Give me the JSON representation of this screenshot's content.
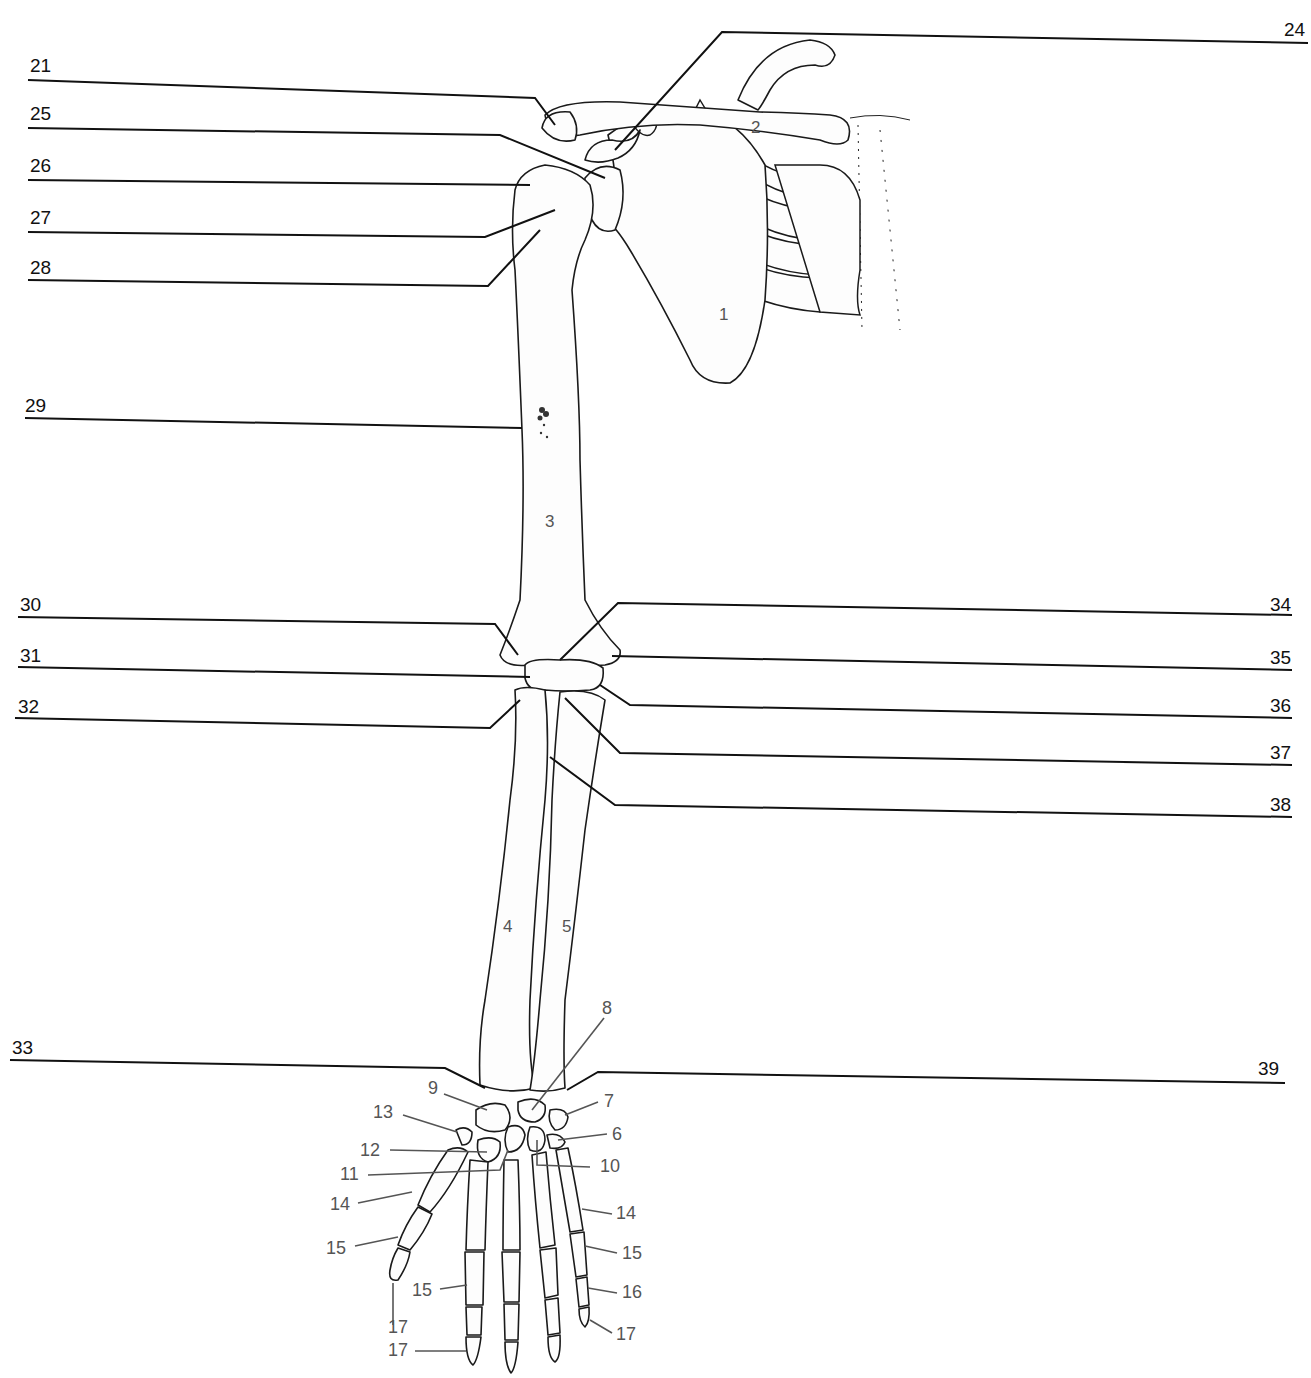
{
  "diagram": {
    "blank_labels": [
      {
        "id": "21",
        "text": "21",
        "side": "left",
        "tx": 30,
        "ty": 72,
        "line": [
          [
            28,
            80
          ],
          [
            535,
            98
          ],
          [
            555,
            125
          ]
        ]
      },
      {
        "id": "25",
        "text": "25",
        "side": "left",
        "tx": 30,
        "ty": 120,
        "line": [
          [
            28,
            128
          ],
          [
            500,
            135
          ],
          [
            605,
            178
          ]
        ]
      },
      {
        "id": "26",
        "text": "26",
        "side": "left",
        "tx": 30,
        "ty": 172,
        "line": [
          [
            28,
            180
          ],
          [
            530,
            185
          ]
        ]
      },
      {
        "id": "27",
        "text": "27",
        "side": "left",
        "tx": 30,
        "ty": 224,
        "line": [
          [
            28,
            232
          ],
          [
            485,
            237
          ],
          [
            555,
            210
          ]
        ]
      },
      {
        "id": "28",
        "text": "28",
        "side": "left",
        "tx": 30,
        "ty": 274,
        "line": [
          [
            28,
            280
          ],
          [
            488,
            286
          ],
          [
            540,
            230
          ]
        ]
      },
      {
        "id": "29",
        "text": "29",
        "side": "left",
        "tx": 25,
        "ty": 412,
        "line": [
          [
            25,
            418
          ],
          [
            522,
            428
          ]
        ]
      },
      {
        "id": "30",
        "text": "30",
        "side": "left",
        "tx": 20,
        "ty": 611,
        "line": [
          [
            18,
            617
          ],
          [
            495,
            624
          ],
          [
            518,
            655
          ]
        ]
      },
      {
        "id": "31",
        "text": "31",
        "side": "left",
        "tx": 20,
        "ty": 662,
        "line": [
          [
            18,
            667
          ],
          [
            530,
            677
          ]
        ]
      },
      {
        "id": "32",
        "text": "32",
        "side": "left",
        "tx": 18,
        "ty": 713,
        "line": [
          [
            15,
            718
          ],
          [
            490,
            728
          ],
          [
            520,
            700
          ]
        ]
      },
      {
        "id": "33",
        "text": "33",
        "side": "left",
        "tx": 12,
        "ty": 1054,
        "line": [
          [
            10,
            1060
          ],
          [
            445,
            1068
          ],
          [
            485,
            1088
          ]
        ]
      },
      {
        "id": "24",
        "text": "24",
        "side": "right",
        "tx": 1284,
        "ty": 36,
        "line": [
          [
            1308,
            43
          ],
          [
            722,
            32
          ],
          [
            615,
            150
          ]
        ]
      },
      {
        "id": "34",
        "text": "34",
        "side": "right",
        "tx": 1270,
        "ty": 611,
        "line": [
          [
            1292,
            615
          ],
          [
            618,
            603
          ],
          [
            560,
            660
          ]
        ]
      },
      {
        "id": "35",
        "text": "35",
        "side": "right",
        "tx": 1270,
        "ty": 664,
        "line": [
          [
            1292,
            670
          ],
          [
            612,
            656
          ]
        ]
      },
      {
        "id": "36",
        "text": "36",
        "side": "right",
        "tx": 1270,
        "ty": 712,
        "line": [
          [
            1292,
            718
          ],
          [
            630,
            705
          ],
          [
            600,
            685
          ]
        ]
      },
      {
        "id": "37",
        "text": "37",
        "side": "right",
        "tx": 1270,
        "ty": 759,
        "line": [
          [
            1292,
            765
          ],
          [
            620,
            753
          ],
          [
            565,
            698
          ]
        ]
      },
      {
        "id": "38",
        "text": "38",
        "side": "right",
        "tx": 1270,
        "ty": 811,
        "line": [
          [
            1292,
            817
          ],
          [
            615,
            805
          ],
          [
            550,
            757
          ]
        ]
      },
      {
        "id": "39",
        "text": "39",
        "side": "right",
        "tx": 1258,
        "ty": 1075,
        "line": [
          [
            1285,
            1083
          ],
          [
            598,
            1072
          ],
          [
            567,
            1090
          ]
        ]
      }
    ],
    "numbered_labels": [
      {
        "id": "6",
        "text": "6",
        "tx": 612,
        "ty": 1140,
        "line": [
          [
            607,
            1134
          ],
          [
            558,
            1140
          ]
        ]
      },
      {
        "id": "7",
        "text": "7",
        "tx": 604,
        "ty": 1107,
        "line": [
          [
            598,
            1102
          ],
          [
            565,
            1115
          ]
        ]
      },
      {
        "id": "8",
        "text": "8",
        "tx": 602,
        "ty": 1014,
        "line": [
          [
            604,
            1018
          ],
          [
            532,
            1110
          ]
        ]
      },
      {
        "id": "9",
        "text": "9",
        "tx": 428,
        "ty": 1094,
        "line": [
          [
            444,
            1094
          ],
          [
            487,
            1110
          ]
        ]
      },
      {
        "id": "10",
        "text": "10",
        "tx": 600,
        "ty": 1172,
        "line": [
          [
            590,
            1167
          ],
          [
            537,
            1165
          ],
          [
            537,
            1140
          ]
        ]
      },
      {
        "id": "11",
        "text": "11",
        "tx": 340,
        "ty": 1180,
        "line": [
          [
            368,
            1175
          ],
          [
            500,
            1170
          ],
          [
            508,
            1150
          ]
        ]
      },
      {
        "id": "12",
        "text": "12",
        "tx": 360,
        "ty": 1156,
        "line": [
          [
            390,
            1150
          ],
          [
            487,
            1152
          ]
        ]
      },
      {
        "id": "13",
        "text": "13",
        "tx": 373,
        "ty": 1118,
        "line": [
          [
            403,
            1115
          ],
          [
            457,
            1132
          ]
        ]
      },
      {
        "id": "14a",
        "text": "14",
        "tx": 330,
        "ty": 1210,
        "line": [
          [
            358,
            1203
          ],
          [
            412,
            1192
          ]
        ]
      },
      {
        "id": "14b",
        "text": "14",
        "tx": 616,
        "ty": 1219,
        "line": [
          [
            612,
            1214
          ],
          [
            582,
            1209
          ]
        ]
      },
      {
        "id": "15a",
        "text": "15",
        "tx": 326,
        "ty": 1254,
        "line": [
          [
            355,
            1246
          ],
          [
            398,
            1237
          ]
        ]
      },
      {
        "id": "15b",
        "text": "15",
        "tx": 412,
        "ty": 1296,
        "line": [
          [
            440,
            1289
          ],
          [
            467,
            1285
          ]
        ]
      },
      {
        "id": "15c",
        "text": "15",
        "tx": 622,
        "ty": 1259,
        "line": [
          [
            617,
            1253
          ],
          [
            585,
            1246
          ]
        ]
      },
      {
        "id": "16",
        "text": "16",
        "tx": 622,
        "ty": 1298,
        "line": [
          [
            617,
            1293
          ],
          [
            588,
            1288
          ]
        ]
      },
      {
        "id": "17a",
        "text": "17",
        "tx": 388,
        "ty": 1333,
        "line": [
          [
            393,
            1283
          ],
          [
            393,
            1325
          ]
        ]
      },
      {
        "id": "17b",
        "text": "17",
        "tx": 388,
        "ty": 1356,
        "line": [
          [
            415,
            1351
          ],
          [
            466,
            1351
          ]
        ]
      },
      {
        "id": "17c",
        "text": "17",
        "tx": 616,
        "ty": 1340,
        "line": [
          [
            612,
            1333
          ],
          [
            590,
            1320
          ]
        ]
      }
    ],
    "bone_numbers": [
      {
        "id": "1",
        "text": "1",
        "tx": 719,
        "ty": 320
      },
      {
        "id": "2",
        "text": "2",
        "tx": 751,
        "ty": 133
      },
      {
        "id": "3",
        "text": "3",
        "tx": 545,
        "ty": 527
      },
      {
        "id": "4",
        "text": "4",
        "tx": 503,
        "ty": 932
      },
      {
        "id": "5",
        "text": "5",
        "tx": 562,
        "ty": 932
      }
    ]
  }
}
